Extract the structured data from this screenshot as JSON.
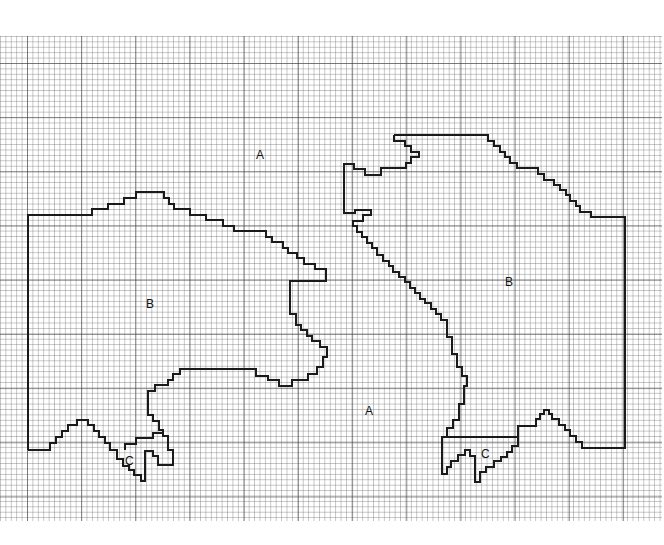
{
  "diagram": {
    "type": "grid-region-map",
    "grid": {
      "top": 36,
      "bottom": 521,
      "left": 0,
      "right": 662,
      "minor_spacing_px": 5.42,
      "major_every": 10
    },
    "labels": [
      {
        "text": "A",
        "x": 256,
        "y": 149
      },
      {
        "text": "B",
        "x": 146,
        "y": 298
      },
      {
        "text": "C",
        "x": 125,
        "y": 455
      },
      {
        "text": "A",
        "x": 365,
        "y": 405
      },
      {
        "text": "B",
        "x": 505,
        "y": 276
      },
      {
        "text": "C",
        "x": 481,
        "y": 448
      }
    ],
    "contours": [
      {
        "name": "left-region-boundary",
        "points": "28,450 28,215 92,215 92,209 108,209 108,204 124,204 124,198 136,198 136,192 164,192 164,198 169,198 169,204 174,204 174,209 190,209 190,215 206,215 206,220 223,220 223,226 234,226 234,231 266,231 266,237 272,237 272,242 283,242 283,248 288,248 288,253 297,253 297,258 304,258 304,264 315,264 315,269 326,269 326,281 290,281 290,314 296,314 296,325 301,325 301,330 307,330 307,336 312,336 312,341 320,341 320,347 327,347 327,357 323,357 323,367 317,367 317,374 308,374 308,380 292,380 292,386 279,386 279,380 268,380 268,376 256,376 256,369 180,369 180,374 173,374 173,380 168,380 168,385 155,385 155,391 148,391 148,415 153,415 153,421 159,421 159,430 163,430 163,436 168,436 168,450 173,450 173,465 158,465 158,456 153,456 153,451 145,451 145,481 141,481 141,475 134,475 134,470 129,470 129,466 123,466 123,459 117,459 117,450 110,450 110,443 105,443 105,437 99,437 99,431 94,431 94,425 88,425 88,420 77,420 77,425 68,425 68,431 62,431 62,437 56,437 56,443 50,443 50,450 28,450"
      },
      {
        "name": "left-inner-c-boundary",
        "points": "125,450 125,444 136,444 136,438 153,438 153,433 163,433"
      },
      {
        "name": "right-region-boundary",
        "points": "394,135 488,135 488,141 494,141 494,146 500,146 500,152 505,152 505,157 510,157 510,163 517,163 517,168 538,168 538,174 544,174 544,180 554,180 554,185 560,185 560,190 566,190 566,195 570,195 570,201 576,201 576,206 580,206 580,212 591,212 591,217 625,217 625,448 582,448 582,442 576,442 576,436 570,436 570,430 565,430 565,425 559,425 559,419 552,419 552,414 549,414 549,410 544,410 544,414 540,414 540,419 536,419 536,426 518,426 518,446 512,446 512,452 507,452 507,457 501,457 501,461 494,461 494,467 486,467 486,472 480,472 480,482 475,482 475,456 470,456 470,450 465,450 465,455 458,455 458,461 451,461 451,467 447,467 447,474 442,474 442,437 447,437 447,428 453,428 453,420 459,420 459,404 464,404 464,386 467,386 467,376 462,376 462,367 457,367 457,354 452,354 452,337 447,337 447,320 441,320 441,314 436,314 436,309 431,309 431,303 425,303 425,299 420,299 420,293 415,293 415,288 410,288 410,282 405,282 405,277 399,277 399,272 393,272 393,266 389,266 389,261 383,261 383,255 377,255 377,248 372,248 372,243 367,243 367,237 362,237 362,232 357,232 357,226 353,226 353,221 363,221 363,215 371,215 371,210 355,210 355,213 344,213 344,164 354,164 354,169 365,169 365,175 381,175 381,168 406,168 406,163 411,163 411,157 419,157 419,152 411,152 411,146 405,146 405,141 394,141 394,135"
      },
      {
        "name": "right-inner-c-boundary",
        "points": "442,437 518,437"
      }
    ]
  }
}
